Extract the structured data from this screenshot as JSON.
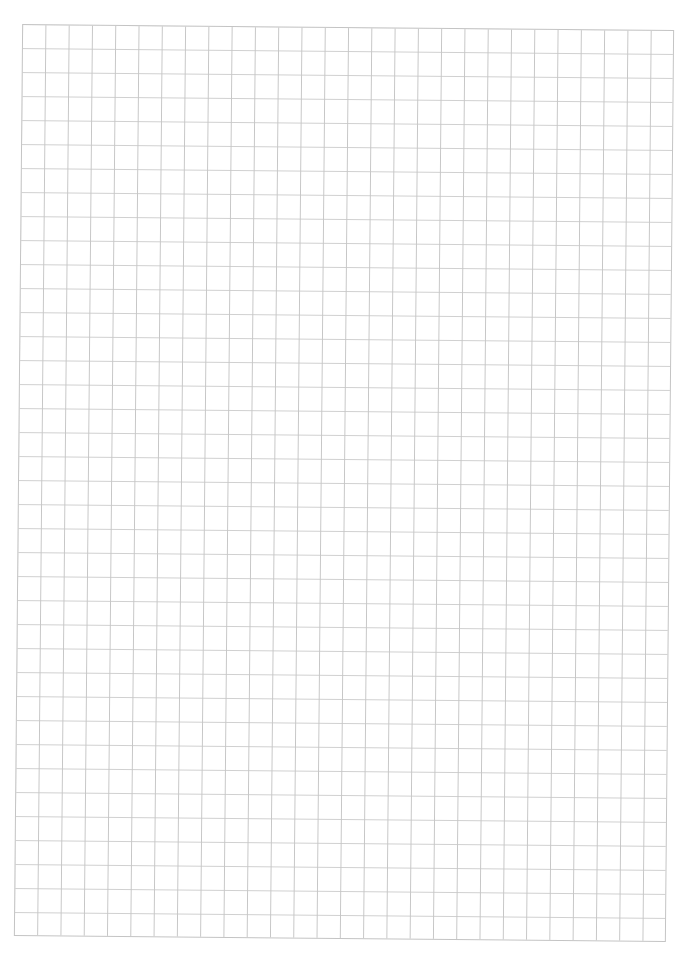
{
  "page": {
    "type": "graph-paper",
    "background_color": "#ffffff"
  },
  "grid": {
    "columns": 28,
    "rows": 38,
    "line_color": "#c8c8c8",
    "border_color": "#c4c4c4",
    "cell_width_px": 23.3,
    "cell_height_px": 24,
    "rotation_deg": 0.52
  }
}
